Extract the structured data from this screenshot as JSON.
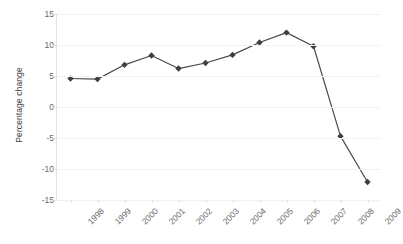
{
  "chart_data": {
    "type": "line",
    "title": "",
    "subtitle": "",
    "xlabel": "",
    "ylabel": "Percentage change",
    "categories": [
      "1998",
      "1999",
      "2000",
      "2001",
      "2002",
      "2003",
      "2004",
      "2005",
      "2006",
      "2007",
      "2008",
      "2009"
    ],
    "values": [
      4.6,
      4.5,
      6.8,
      8.3,
      6.2,
      7.1,
      8.4,
      10.4,
      12.0,
      9.8,
      -4.7,
      -12.1
    ],
    "series": [
      {
        "name": "Percentage change",
        "values": [
          4.6,
          4.5,
          6.8,
          8.3,
          6.2,
          7.1,
          8.4,
          10.4,
          12.0,
          9.8,
          -4.7,
          -12.1
        ]
      }
    ],
    "ylim": [
      -15,
      15
    ],
    "ytick_labels": [
      "15",
      "10",
      "5",
      "0",
      "-5",
      "-10",
      "-15"
    ],
    "ytick_values": [
      15,
      10,
      5,
      0,
      -5,
      -10,
      -15
    ],
    "grid": true,
    "legend": false,
    "legend_position": "none",
    "marker": "diamond",
    "xtick_rotation": -45,
    "colors": {
      "line": "#4a4a4a",
      "marker": "#3f3f3f",
      "grid": "#f2f2f2",
      "axis": "#e0e0e0",
      "tick_label": "#6b6b6b",
      "axis_title": "#3f3f3f",
      "background": "#ffffff"
    }
  }
}
